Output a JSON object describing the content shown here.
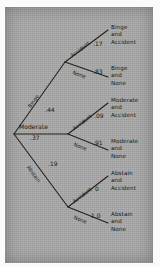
{
  "diagram": {
    "type": "probability-tree",
    "title": "",
    "paper_color": "#a8a8a8",
    "ink_color": "#1a1a18",
    "root": {
      "label": "",
      "x": 14,
      "y": 134
    },
    "level1": [
      {
        "id": "binge",
        "name": "Binge",
        "prob": ".44",
        "x": 65,
        "y": 62
      },
      {
        "id": "moderate",
        "name": "Moderate",
        "prob": ".37",
        "x": 68,
        "y": 134
      },
      {
        "id": "abstain",
        "name": "Abstain",
        "prob": ".19",
        "x": 68,
        "y": 207
      }
    ],
    "level2": [
      {
        "parent": "binge",
        "name": "Accident",
        "prob": ".17",
        "leaf": [
          "Binge",
          "and",
          "Accident"
        ]
      },
      {
        "parent": "binge",
        "name": "None",
        "prob": ".83",
        "leaf": [
          "Binge",
          "and",
          "None"
        ]
      },
      {
        "parent": "moderate",
        "name": "Accident",
        "prob": ".09",
        "leaf": [
          "Moderate",
          "and",
          "Accident"
        ]
      },
      {
        "parent": "moderate",
        "name": "None",
        "prob": ".91",
        "leaf": [
          "Moderate",
          "and",
          "None"
        ]
      },
      {
        "parent": "abstain",
        "name": "Accident",
        "prob": "0",
        "leaf": [
          "Abstain",
          "and",
          "Accident"
        ]
      },
      {
        "parent": "abstain",
        "name": "None",
        "prob": "1.0",
        "leaf": [
          "Abstain",
          "and",
          "None"
        ]
      }
    ]
  }
}
